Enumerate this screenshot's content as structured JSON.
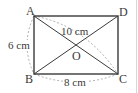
{
  "figure": {
    "shape": "rectangle ABCD with diagonals intersecting at O",
    "points": {
      "A": {
        "label": "A",
        "x": 34,
        "y": 16
      },
      "B": {
        "label": "B",
        "x": 34,
        "y": 74
      },
      "C": {
        "label": "C",
        "x": 118,
        "y": 74
      },
      "D": {
        "label": "D",
        "x": 118,
        "y": 16
      },
      "O": {
        "label": "O",
        "x": 76,
        "y": 45
      }
    },
    "dimensions": {
      "diagonal": "10 cm",
      "side_AB": "6 cm",
      "side_BC": "8 cm"
    },
    "colors": {
      "stroke": "#3a3a3a",
      "dashed": "#9a9a9a",
      "text": "#3a3a3a"
    }
  }
}
